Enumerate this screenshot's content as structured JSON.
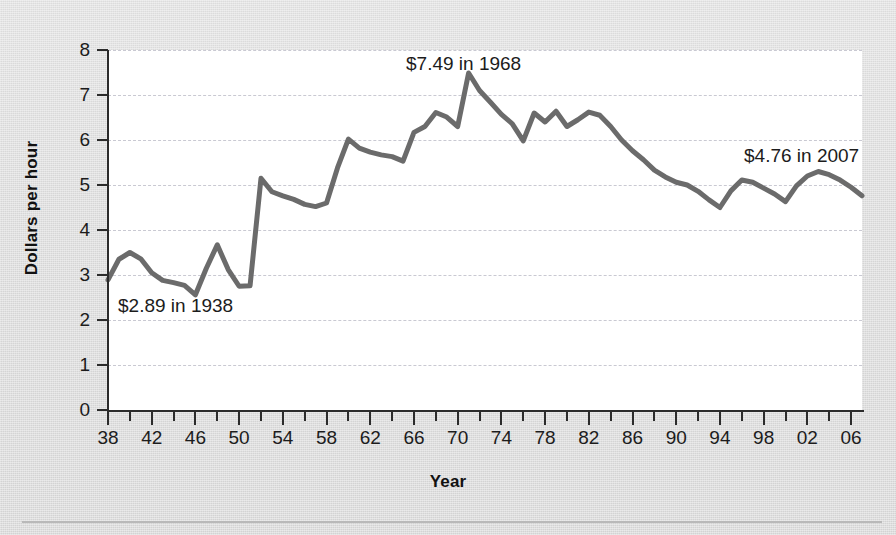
{
  "chart_data": {
    "type": "line",
    "title": "",
    "subtitle": "",
    "xlabel": "Year",
    "ylabel": "Dollars per hour",
    "xlim": [
      1938,
      2007
    ],
    "ylim": [
      0,
      8
    ],
    "grid": true,
    "legend": "none",
    "line_color": "#6b6b6b",
    "series": [
      {
        "name": "Minimum wage in constant dollars",
        "x": [
          1938,
          1939,
          1940,
          1941,
          1942,
          1943,
          1944,
          1945,
          1946,
          1947,
          1948,
          1949,
          1950,
          1951,
          1952,
          1953,
          1954,
          1955,
          1956,
          1957,
          1958,
          1959,
          1960,
          1961,
          1962,
          1963,
          1964,
          1965,
          1966,
          1967,
          1968,
          1969,
          1970,
          1971,
          1972,
          1973,
          1974,
          1975,
          1976,
          1977,
          1978,
          1979,
          1980,
          1981,
          1982,
          1983,
          1984,
          1985,
          1986,
          1987,
          1988,
          1989,
          1990,
          1991,
          1992,
          1993,
          1994,
          1995,
          1996,
          1997,
          1998,
          1999,
          2000,
          2001,
          2002,
          2003,
          2004,
          2005,
          2006,
          2007
        ],
        "y": [
          2.89,
          3.35,
          3.5,
          3.36,
          3.05,
          2.88,
          2.83,
          2.77,
          2.56,
          3.15,
          3.67,
          3.12,
          2.75,
          2.76,
          5.15,
          4.85,
          4.76,
          4.68,
          4.57,
          4.52,
          4.6,
          5.38,
          6.02,
          5.82,
          5.73,
          5.67,
          5.63,
          5.53,
          6.17,
          6.3,
          6.61,
          6.51,
          6.3,
          7.49,
          7.1,
          6.84,
          6.57,
          6.36,
          5.98,
          6.6,
          6.4,
          6.64,
          6.3,
          6.45,
          6.62,
          6.55,
          6.3,
          6.0,
          5.76,
          5.56,
          5.33,
          5.18,
          5.06,
          5.0,
          4.86,
          4.67,
          4.5,
          4.87,
          5.11,
          5.06,
          4.93,
          4.8,
          4.63,
          4.98,
          5.2,
          5.3,
          5.23,
          5.11,
          4.95,
          4.76
        ]
      }
    ],
    "y_ticks": [
      "0",
      "1",
      "2",
      "3",
      "4",
      "5",
      "6",
      "7",
      "8"
    ],
    "x_ticks": [
      "38",
      "42",
      "46",
      "50",
      "54",
      "58",
      "62",
      "66",
      "70",
      "74",
      "78",
      "82",
      "86",
      "90",
      "94",
      "98",
      "02",
      "06"
    ],
    "annotations": [
      {
        "id": "annotation-1938",
        "text": "$2.89 in 1938",
        "value": 2.89,
        "year": 1938
      },
      {
        "id": "annotation-1968",
        "text": "$7.49 in 1968",
        "value": 7.49,
        "year": 1968
      },
      {
        "id": "annotation-2007",
        "text": "$4.76 in 2007",
        "value": 4.76,
        "year": 2007
      }
    ]
  },
  "axes": {
    "y_title": "Dollars per hour",
    "x_title": "Year"
  }
}
